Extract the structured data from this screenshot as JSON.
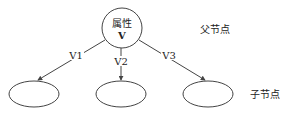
{
  "diagram": {
    "type": "decision-tree-node",
    "parent": {
      "line1": "属性",
      "line2": "V"
    },
    "parent_label": "父节点",
    "child_label": "子节点",
    "edges": [
      {
        "label": "V1"
      },
      {
        "label": "V2"
      },
      {
        "label": "V3"
      }
    ],
    "colors": {
      "stroke": "#444444",
      "text": "#222222",
      "background": "#ffffff"
    }
  }
}
